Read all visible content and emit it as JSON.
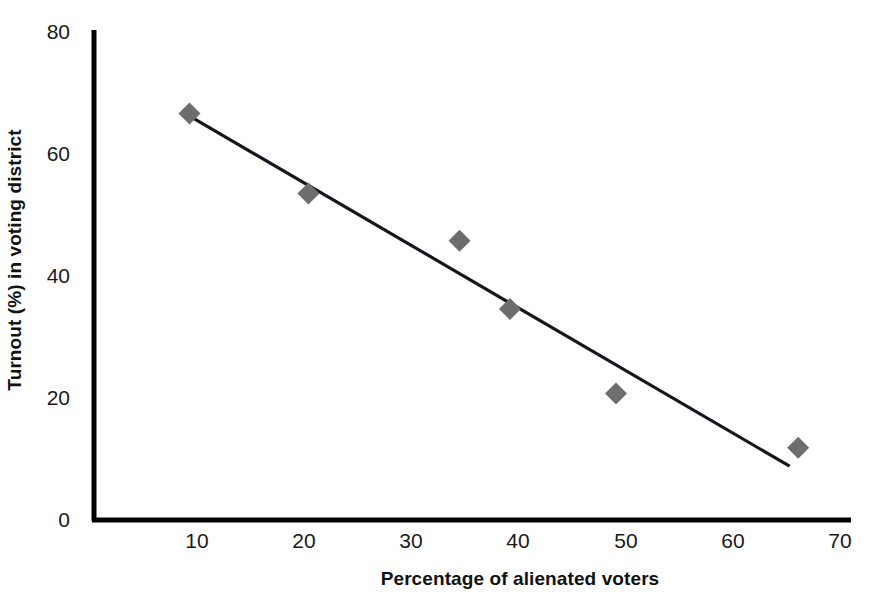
{
  "chart_data": {
    "type": "scatter",
    "title": "",
    "xlabel": "Percentage of alienated voters",
    "ylabel": "Turnout (%) in voting district",
    "xlim": [
      4,
      70
    ],
    "ylim": [
      0,
      80
    ],
    "xticks": [
      "10",
      "20",
      "30",
      "40",
      "50",
      "60",
      "70"
    ],
    "xtick_values": [
      10,
      20,
      30,
      40,
      50,
      60,
      70
    ],
    "yticks": [
      "0",
      "20",
      "40",
      "60",
      "80"
    ],
    "ytick_values": [
      0,
      20,
      40,
      60,
      80
    ],
    "grid": false,
    "legend": false,
    "series": [
      {
        "name": "Voting districts",
        "marker": "diamond",
        "color": "#6d6d6d",
        "points": [
          {
            "x": 9.3,
            "y": 66.5
          },
          {
            "x": 20.4,
            "y": 53.4
          },
          {
            "x": 34.5,
            "y": 45.7
          },
          {
            "x": 39.2,
            "y": 34.5
          },
          {
            "x": 49.1,
            "y": 20.7
          },
          {
            "x": 66.1,
            "y": 11.8
          }
        ]
      }
    ],
    "trendline": {
      "name": "Linear trend",
      "color": "#16161e",
      "x_start": 9.0,
      "y_start": 66.4,
      "x_end": 65.3,
      "y_end": 8.8
    },
    "axis_color": "#000000"
  }
}
